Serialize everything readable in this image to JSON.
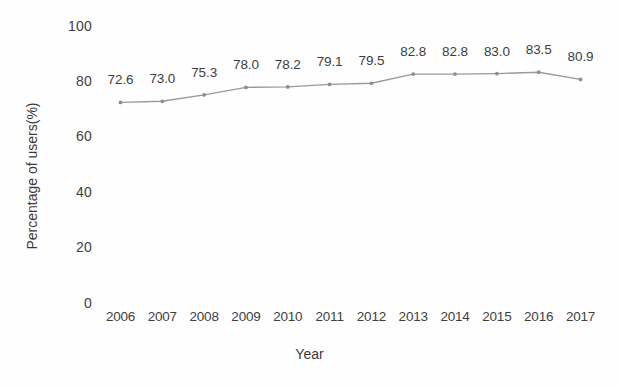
{
  "chart_data": {
    "type": "line",
    "title": "",
    "xlabel": "Year",
    "ylabel": "Percentage of users(%)",
    "categories": [
      "2006",
      "2007",
      "2008",
      "2009",
      "2010",
      "2011",
      "2012",
      "2013",
      "2014",
      "2015",
      "2016",
      "2017"
    ],
    "values": [
      72.6,
      73.0,
      75.3,
      78.0,
      78.2,
      79.1,
      79.5,
      82.8,
      82.8,
      83.0,
      83.5,
      80.9
    ],
    "point_labels": [
      "72.6",
      "73.0",
      "75.3",
      "78.0",
      "78.2",
      "79.1",
      "79.5",
      "82.8",
      "82.8",
      "83.0",
      "83.5",
      "80.9"
    ],
    "ylim": [
      0,
      100
    ],
    "yticks": [
      0,
      20,
      40,
      60,
      80,
      100
    ],
    "ytick_labels": [
      "0",
      "20",
      "40",
      "60",
      "80",
      "100"
    ],
    "grid": false,
    "legend": false,
    "series_color": "#9a9a9a",
    "marker_color": "#8e8e8e",
    "text_color": "#3f3f3f",
    "background_color": "#fefefe"
  }
}
